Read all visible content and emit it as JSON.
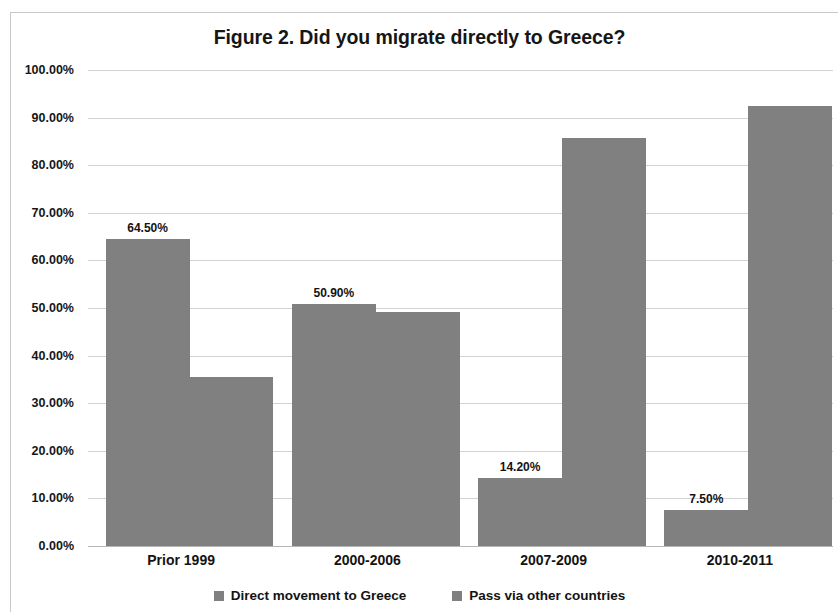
{
  "chart_data": {
    "type": "bar",
    "title": "Figure 2. Did you migrate directly to Greece?",
    "xlabel": "",
    "ylabel": "",
    "categories": [
      "Prior 1999",
      "2000-2006",
      "2007-2009",
      "2010-2011"
    ],
    "series": [
      {
        "name": "Direct movement to Greece",
        "values": [
          64.5,
          50.9,
          14.2,
          7.5
        ],
        "value_labels": [
          "64.50%",
          "50.90%",
          "14.20%",
          "7.50%"
        ],
        "color": "#808080"
      },
      {
        "name": "Pass via other countries",
        "values": [
          35.5,
          49.1,
          85.8,
          92.5
        ],
        "value_labels": [
          "",
          "",
          "",
          ""
        ],
        "color": "#808080"
      }
    ],
    "ylim": [
      0,
      100
    ],
    "ytick_values": [
      0,
      10,
      20,
      30,
      40,
      50,
      60,
      70,
      80,
      90,
      100
    ],
    "ytick_labels": [
      "0.00%",
      "10.00%",
      "20.00%",
      "30.00%",
      "40.00%",
      "50.00%",
      "60.00%",
      "70.00%",
      "80.00%",
      "90.00%",
      "100.00%"
    ],
    "grid": true,
    "grid_color": "#d2d2d2",
    "legend_position": "bottom",
    "bar_gap_within_group": 0,
    "background": "#ffffff"
  }
}
